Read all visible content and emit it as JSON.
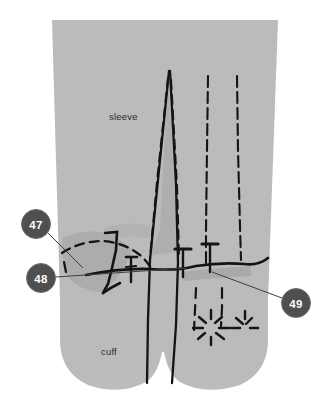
{
  "figure": {
    "background_color": "#ffffff",
    "fabric_color": "#bcbcbc",
    "fabric_shadow_color": "#a6a6a6",
    "ink_color": "#1a1a1a",
    "callout_fill": "#4f4f4f",
    "callout_text_color": "#ffffff",
    "leader_line_color": "#4a4a4a"
  },
  "labels": {
    "sleeve": "sleeve",
    "cuff": "cuff"
  },
  "callouts": [
    {
      "id": "callout-47",
      "number": "47",
      "cx": 36,
      "cy": 224,
      "r": 14.5
    },
    {
      "id": "callout-48",
      "number": "48",
      "cx": 41,
      "cy": 278,
      "r": 14.5
    },
    {
      "id": "callout-49",
      "number": "49",
      "cx": 296,
      "cy": 303,
      "r": 14.5
    }
  ],
  "annotations": {
    "pin_count": 3,
    "dart_count": 1,
    "stitch_line_count": 2,
    "asterisk_marks": 2
  }
}
